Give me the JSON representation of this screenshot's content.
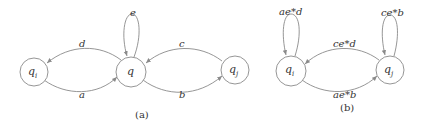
{
  "diagrams": [
    {
      "caption": "(a)",
      "nodes": [
        {
          "id": "qi",
          "label": "q",
          "sub": "i"
        },
        {
          "id": "q",
          "label": "q",
          "sub": ""
        },
        {
          "id": "qj",
          "label": "q",
          "sub": "j"
        }
      ],
      "edges": [
        {
          "from": "q",
          "to": "qi",
          "label": "d"
        },
        {
          "from": "qi",
          "to": "q",
          "label": "a"
        },
        {
          "from": "q",
          "to": "q",
          "label": "e"
        },
        {
          "from": "qj",
          "to": "q",
          "label": "c"
        },
        {
          "from": "q",
          "to": "qj",
          "label": "b"
        }
      ]
    },
    {
      "caption": "(b)",
      "nodes": [
        {
          "id": "qi",
          "label": "q",
          "sub": "i"
        },
        {
          "id": "qj",
          "label": "q",
          "sub": "j"
        }
      ],
      "edges": [
        {
          "from": "qi",
          "to": "qi",
          "label": "ae*d"
        },
        {
          "from": "qj",
          "to": "qj",
          "label": "ce*b"
        },
        {
          "from": "qj",
          "to": "qi",
          "label": "ce*d"
        },
        {
          "from": "qi",
          "to": "qj",
          "label": "ae*b"
        }
      ]
    }
  ],
  "colors": {
    "stroke": "#8a8a8a",
    "text": "#333333"
  }
}
